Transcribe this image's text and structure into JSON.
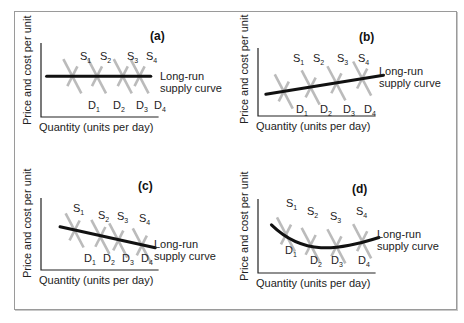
{
  "chart_data": [
    {
      "type": "line",
      "panel": "(a)",
      "title": "(a)",
      "xlabel": "Quantity (units per day)",
      "ylabel": "Price and cost per unit",
      "supply_labels": [
        "S1",
        "S2",
        "S3",
        "S4"
      ],
      "demand_labels": [
        "D1",
        "D2",
        "D3",
        "D4"
      ],
      "long_run_label": [
        "Long-run",
        "supply curve"
      ],
      "long_run_shape": "horizontal",
      "intersections": [
        {
          "q": 0.28,
          "p": 0.55
        },
        {
          "q": 0.5,
          "p": 0.55
        },
        {
          "q": 0.73,
          "p": 0.55
        },
        {
          "q": 0.88,
          "p": 0.55
        }
      ],
      "long_run_curve": {
        "x": [
          0.05,
          0.98
        ],
        "y": [
          0.55,
          0.55
        ]
      }
    },
    {
      "type": "line",
      "panel": "(b)",
      "title": "(b)",
      "xlabel": "Quantity (units per day)",
      "ylabel": "Price and cost per unit",
      "supply_labels": [
        "S1",
        "S2",
        "S3",
        "S4"
      ],
      "demand_labels": [
        "D1",
        "D2",
        "D3",
        "D4"
      ],
      "long_run_label": [
        "Long-run",
        "supply curve"
      ],
      "long_run_shape": "upward-sloping",
      "intersections": [
        {
          "q": 0.23,
          "p": 0.36
        },
        {
          "q": 0.47,
          "p": 0.42
        },
        {
          "q": 0.7,
          "p": 0.48
        },
        {
          "q": 0.93,
          "p": 0.55
        }
      ],
      "long_run_curve": {
        "x": [
          0.07,
          1.12
        ],
        "y": [
          0.32,
          0.6
        ]
      }
    },
    {
      "type": "line",
      "panel": "(c)",
      "title": "(c)",
      "xlabel": "Quantity (units per day)",
      "ylabel": "Price and cost per unit",
      "supply_labels": [
        "S1",
        "S2",
        "S3",
        "S4"
      ],
      "demand_labels": [
        "D1",
        "D2",
        "D3",
        "D4"
      ],
      "long_run_label": [
        "Long-run",
        "supply curve"
      ],
      "long_run_shape": "downward-sloping",
      "intersections": [
        {
          "q": 0.3,
          "p": 0.55
        },
        {
          "q": 0.53,
          "p": 0.46
        },
        {
          "q": 0.69,
          "p": 0.41
        },
        {
          "q": 0.9,
          "p": 0.34
        }
      ],
      "long_run_curve": {
        "x": [
          0.17,
          1.02
        ],
        "y": [
          0.6,
          0.31
        ]
      }
    },
    {
      "type": "line",
      "panel": "(d)",
      "title": "(d)",
      "xlabel": "Quantity (units per day)",
      "ylabel": "Price and cost per unit",
      "supply_labels": [
        "S1",
        "S2",
        "S3",
        "S4"
      ],
      "demand_labels": [
        "D1",
        "D2",
        "D3",
        "D4"
      ],
      "long_run_label": [
        "Long-run",
        "supply curve"
      ],
      "long_run_shape": "U-shaped",
      "intersections": [
        {
          "q": 0.25,
          "p": 0.52
        },
        {
          "q": 0.47,
          "p": 0.38
        },
        {
          "q": 0.7,
          "p": 0.36
        },
        {
          "q": 0.93,
          "p": 0.43
        }
      ],
      "long_run_curve": {
        "x": [
          0.12,
          0.4,
          0.7,
          1.08
        ],
        "y": [
          0.65,
          0.4,
          0.35,
          0.48
        ]
      }
    }
  ],
  "colors": {
    "long_run": "#111111",
    "supply_demand": "#b4b4b4",
    "axis": "#222222",
    "frame": "#9a9a9a"
  }
}
